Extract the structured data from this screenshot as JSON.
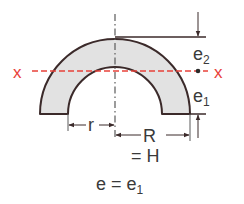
{
  "diagram": {
    "type": "semicircular-ring-cross-section",
    "colors": {
      "fill": "#e2e2e2",
      "outline": "#3b2a2a",
      "dimension": "#3b2a2a",
      "centerline": "#5a5a5a",
      "neutral_axis": "#e8413a",
      "text": "#3a3a3a"
    },
    "axis": {
      "left_label": "x",
      "right_label": "x"
    },
    "dimensions": {
      "inner_radius": "r",
      "outer_radius": "R",
      "top_distance_base": "e",
      "top_distance_sub": "2",
      "bottom_distance_base": "e",
      "bottom_distance_sub": "1"
    },
    "formulas": {
      "height_eq": "= H",
      "e_eq_base": "e = e",
      "e_eq_sub": "1"
    }
  }
}
